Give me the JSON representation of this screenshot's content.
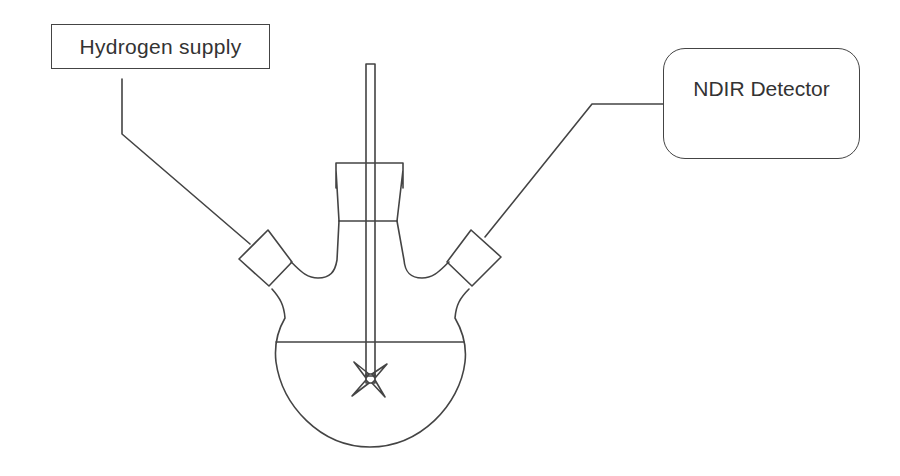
{
  "diagram": {
    "type": "apparatus-schematic",
    "labels": {
      "hydrogen_supply": "Hydrogen supply",
      "ndir_detector": "NDIR Detector"
    },
    "components": [
      {
        "name": "three-neck-flask",
        "description": "Round-bottom flask with central neck and two angled side necks"
      },
      {
        "name": "stopper",
        "description": "Central neck ground-glass stopper/adapter"
      },
      {
        "name": "stirrer-shaft",
        "description": "Vertical stirrer rod passing through central neck"
      },
      {
        "name": "impeller",
        "description": "Star-shaped stirrer blade at bottom of shaft"
      },
      {
        "name": "liquid-level",
        "description": "Horizontal line marking liquid surface in flask"
      },
      {
        "name": "left-septum",
        "description": "Square stopper on left side neck"
      },
      {
        "name": "right-septum",
        "description": "Square stopper on right side neck"
      }
    ],
    "connections": [
      {
        "from": "Hydrogen supply",
        "to": "left side neck"
      },
      {
        "from": "right side neck",
        "to": "NDIR Detector"
      }
    ],
    "colors": {
      "line": "#444444",
      "background": "#ffffff",
      "text": "#333333"
    }
  }
}
